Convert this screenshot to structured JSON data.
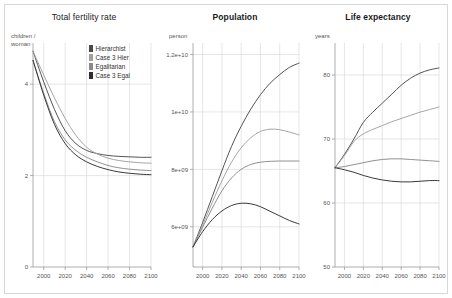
{
  "figure": {
    "background": "#ffffff",
    "frame_color": "#d8d8d8",
    "grid_color": "#d5d5d5",
    "axis_color": "#9a9a9a"
  },
  "legend": {
    "position": "inside-panel-1-top-right",
    "entries": [
      {
        "label": "Hierarchist",
        "color": "#4a4a4a"
      },
      {
        "label": "Case 3 Hier",
        "color": "#a0a0a0"
      },
      {
        "label": "Egalitarian",
        "color": "#8a8a8a"
      },
      {
        "label": "Case 3 Egal",
        "color": "#2e2e2e"
      }
    ]
  },
  "chart_data": [
    {
      "type": "line",
      "title": "Total fertility rate",
      "ylabel": "children /\nwoman",
      "xlabel": "",
      "xlim": [
        1990,
        2100
      ],
      "ylim": [
        0,
        4.9
      ],
      "xticks": [
        2000,
        2020,
        2040,
        2060,
        2080,
        2100
      ],
      "yticks": [
        0,
        2,
        4
      ],
      "grid": true,
      "x": [
        1990,
        2000,
        2010,
        2020,
        2030,
        2040,
        2050,
        2060,
        2070,
        2080,
        2090,
        2100
      ],
      "series": [
        {
          "name": "Hierarchist",
          "color": "#4a4a4a",
          "values": [
            4.72,
            4.05,
            3.45,
            2.98,
            2.7,
            2.55,
            2.48,
            2.44,
            2.42,
            2.41,
            2.4,
            2.4
          ]
        },
        {
          "name": "Case 3 Hier",
          "color": "#a0a0a0",
          "values": [
            4.72,
            4.2,
            3.7,
            3.25,
            2.88,
            2.62,
            2.47,
            2.38,
            2.33,
            2.3,
            2.28,
            2.27
          ]
        },
        {
          "name": "Egalitarian",
          "color": "#8a8a8a",
          "values": [
            4.52,
            3.8,
            3.18,
            2.78,
            2.55,
            2.4,
            2.3,
            2.22,
            2.17,
            2.14,
            2.12,
            2.11
          ]
        },
        {
          "name": "Case 3 Egal",
          "color": "#2e2e2e",
          "values": [
            4.52,
            3.76,
            3.12,
            2.7,
            2.45,
            2.3,
            2.2,
            2.13,
            2.08,
            2.05,
            2.03,
            2.02
          ]
        }
      ]
    },
    {
      "type": "line",
      "title": "Population",
      "ylabel": "person",
      "xlabel": "",
      "xlim": [
        1990,
        2100
      ],
      "ylim": [
        4600000000,
        12400000000
      ],
      "xticks": [
        2000,
        2020,
        2040,
        2060,
        2080,
        2100
      ],
      "yticks": [
        6000000000,
        8000000000,
        10000000000,
        12000000000
      ],
      "ytick_labels": [
        "6e+09",
        "8e+09",
        "1e+10",
        "1.2e+10"
      ],
      "grid": true,
      "x": [
        1990,
        2000,
        2010,
        2020,
        2030,
        2040,
        2050,
        2060,
        2070,
        2080,
        2090,
        2100
      ],
      "series": [
        {
          "name": "Hierarchist",
          "color": "#4a4a4a",
          "values": [
            5300000000,
            6150000000,
            7050000000,
            7950000000,
            8800000000,
            9500000000,
            10100000000,
            10600000000,
            11000000000,
            11300000000,
            11550000000,
            11700000000
          ]
        },
        {
          "name": "Case 3 Hier",
          "color": "#a0a0a0",
          "values": [
            5300000000,
            6050000000,
            6850000000,
            7600000000,
            8250000000,
            8750000000,
            9100000000,
            9320000000,
            9400000000,
            9380000000,
            9300000000,
            9200000000
          ]
        },
        {
          "name": "Egalitarian",
          "color": "#8a8a8a",
          "values": [
            5300000000,
            5980000000,
            6650000000,
            7250000000,
            7700000000,
            8000000000,
            8170000000,
            8250000000,
            8280000000,
            8290000000,
            8290000000,
            8290000000
          ]
        },
        {
          "name": "Case 3 Egal",
          "color": "#2e2e2e",
          "values": [
            5300000000,
            5830000000,
            6250000000,
            6550000000,
            6740000000,
            6820000000,
            6800000000,
            6700000000,
            6540000000,
            6380000000,
            6220000000,
            6100000000
          ]
        }
      ]
    },
    {
      "type": "line",
      "title": "Life expectancy",
      "ylabel": "years",
      "xlabel": "",
      "xlim": [
        1990,
        2100
      ],
      "ylim": [
        50,
        85
      ],
      "xticks": [
        2000,
        2020,
        2040,
        2060,
        2080,
        2100
      ],
      "yticks": [
        50,
        60,
        70,
        80
      ],
      "grid": true,
      "x": [
        1990,
        2000,
        2010,
        2020,
        2030,
        2040,
        2050,
        2060,
        2070,
        2080,
        2090,
        2100
      ],
      "series": [
        {
          "name": "Hierarchist",
          "color": "#4a4a4a",
          "values": [
            65.5,
            67.6,
            70.0,
            72.6,
            74.2,
            75.6,
            77.0,
            78.4,
            79.5,
            80.3,
            80.8,
            81.1
          ]
        },
        {
          "name": "Case 3 Hier",
          "color": "#a0a0a0",
          "values": [
            65.5,
            67.4,
            69.6,
            70.8,
            71.5,
            72.1,
            72.7,
            73.2,
            73.7,
            74.2,
            74.6,
            75.0
          ]
        },
        {
          "name": "Egalitarian",
          "color": "#8a8a8a",
          "values": [
            65.5,
            65.7,
            66.0,
            66.3,
            66.6,
            66.8,
            66.9,
            66.9,
            66.8,
            66.7,
            66.6,
            66.5
          ]
        },
        {
          "name": "Case 3 Egal",
          "color": "#2e2e2e",
          "values": [
            65.5,
            65.2,
            64.8,
            64.3,
            63.9,
            63.6,
            63.4,
            63.3,
            63.3,
            63.4,
            63.5,
            63.5
          ]
        }
      ]
    }
  ]
}
